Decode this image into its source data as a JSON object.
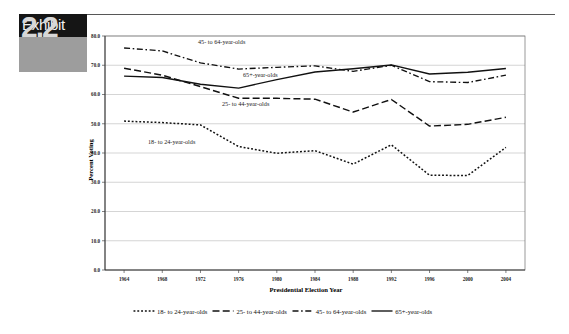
{
  "exhibit": {
    "label": "Exhibit",
    "number": "2.2"
  },
  "chart_data": {
    "type": "line",
    "title": "",
    "xlabel": "Presidential Election Year",
    "ylabel": "Percent Voting",
    "x": [
      1964,
      1968,
      1972,
      1976,
      1980,
      1984,
      1988,
      1992,
      1996,
      2000,
      2004
    ],
    "categories": [
      "1964",
      "1968",
      "1972",
      "1976",
      "1980",
      "1984",
      "1988",
      "1992",
      "1996",
      "2000",
      "2004"
    ],
    "xlim": [
      1962,
      2006
    ],
    "ylim": [
      0.0,
      80.0
    ],
    "ytick_labels": [
      "0.0",
      "10.0",
      "20.0",
      "30.0",
      "40.0",
      "50.0",
      "60.0",
      "70.0",
      "80.0"
    ],
    "yticks": [
      0,
      10,
      20,
      30,
      40,
      50,
      60,
      70,
      80
    ],
    "grid": true,
    "legend_position": "bottom",
    "series": [
      {
        "name": "18- to 24-year-olds",
        "style": "dotted",
        "annotation": "18- to 24-year-olds",
        "values": [
          50.9,
          50.4,
          49.6,
          42.2,
          39.9,
          40.8,
          36.2,
          42.8,
          32.4,
          32.3,
          41.9
        ]
      },
      {
        "name": "25- to 44-year-olds",
        "style": "dashed",
        "annotation": "25- to 44-year-olds",
        "values": [
          69.0,
          66.6,
          62.7,
          58.7,
          58.7,
          58.4,
          54.0,
          58.3,
          49.2,
          49.8,
          52.2
        ]
      },
      {
        "name": "45- to 64-year-olds",
        "style": "dash-dot",
        "annotation": "45- to 64-year-olds",
        "values": [
          75.9,
          74.9,
          70.8,
          68.7,
          69.3,
          69.8,
          67.9,
          70.0,
          64.4,
          64.1,
          66.6
        ]
      },
      {
        "name": "65+-year-olds",
        "style": "solid",
        "annotation": "65+-year-olds",
        "values": [
          66.3,
          65.8,
          63.5,
          62.2,
          65.1,
          67.7,
          68.8,
          70.1,
          67.0,
          67.6,
          68.9
        ]
      }
    ]
  },
  "legend": {
    "items": [
      {
        "label": "18- to 24-year-olds",
        "style": "dotted"
      },
      {
        "label": "25- to 44-year-olds",
        "style": "dashed"
      },
      {
        "label": "45- to 64-year-olds",
        "style": "dash-dot"
      },
      {
        "label": "65+-year-olds",
        "style": "solid"
      }
    ]
  },
  "colors": {
    "line": "#111111",
    "grid": "#b9b9b9",
    "axis": "#2b2b2b",
    "badge_dark": "#151515",
    "badge_gray": "#9d9d9d"
  }
}
